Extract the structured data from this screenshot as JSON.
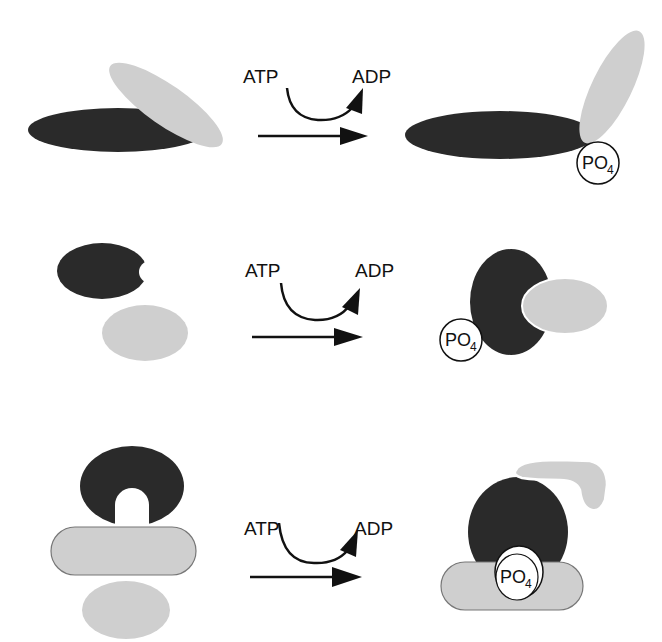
{
  "colors": {
    "dark_protein": "#2a2a2a",
    "light_protein": "#cfcfcf",
    "outline": "#777777",
    "arrow": "#111111",
    "background": "#ffffff"
  },
  "rows": [
    {
      "id": "row-1",
      "description": "Phosphorylation causes conformational change of attached domain",
      "cofactor_in": "ATP",
      "cofactor_out": "ADP",
      "product_label": "PO",
      "product_subscript": "4"
    },
    {
      "id": "row-2",
      "description": "Phosphorylation creates binding site for partner protein",
      "cofactor_in": "ATP",
      "cofactor_out": "ADP",
      "product_label": "PO",
      "product_subscript": "4"
    },
    {
      "id": "row-3",
      "description": "Phosphorylation mediates docking and recruitment of substrate",
      "cofactor_in": "ATP",
      "cofactor_out": "ADP",
      "product_label": "PO",
      "product_subscript": "4"
    }
  ]
}
